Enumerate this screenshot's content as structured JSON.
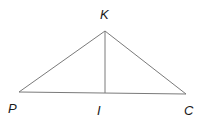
{
  "diagram": {
    "type": "geometry-triangle",
    "colors": {
      "line": "#7a7a7a",
      "label": "#1a1a1a",
      "background": "#ffffff"
    },
    "points": {
      "K": {
        "label": "K",
        "x": 105,
        "y": 31,
        "label_x": 100,
        "label_y": 19
      },
      "P": {
        "label": "P",
        "x": 19,
        "y": 92,
        "label_x": 8,
        "label_y": 113
      },
      "I": {
        "label": "I",
        "x": 105,
        "y": 93,
        "label_x": 97,
        "label_y": 115
      },
      "C": {
        "label": "C",
        "x": 186,
        "y": 94,
        "label_x": 184,
        "label_y": 115
      }
    },
    "segments": [
      {
        "name": "segment-PK",
        "from": "P",
        "to": "K"
      },
      {
        "name": "segment-KC",
        "from": "K",
        "to": "C"
      },
      {
        "name": "segment-PC",
        "from": "P",
        "to": "C"
      },
      {
        "name": "segment-KI",
        "from": "K",
        "to": "I"
      }
    ]
  }
}
